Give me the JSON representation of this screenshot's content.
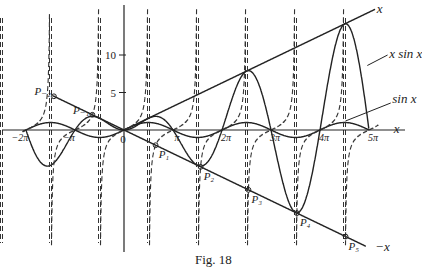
{
  "figure": {
    "caption": "Fig. 18"
  },
  "chart_data": {
    "type": "line",
    "title": "",
    "xlabel": "x",
    "ylabel": "",
    "xlim": [
      -6.5,
      16.3
    ],
    "ylim": [
      -16.5,
      16.5
    ],
    "grid": false,
    "legend": "inline labels",
    "origin_label": "0",
    "x_ticks": [
      {
        "value": -6.2832,
        "label": "−2π"
      },
      {
        "value": -3.1416,
        "label": "−π"
      },
      {
        "value": 3.1416,
        "label": "π"
      },
      {
        "value": 6.2832,
        "label": "2π"
      },
      {
        "value": 9.4248,
        "label": "3π"
      },
      {
        "value": 12.5664,
        "label": "4π"
      },
      {
        "value": 15.708,
        "label": "5π"
      }
    ],
    "y_ticks": [
      {
        "value": 5,
        "label": "5"
      },
      {
        "value": 10,
        "label": "10"
      }
    ],
    "series": [
      {
        "name": "x sin x",
        "expr": "x*sin(x)",
        "style": "solid",
        "x_range": [
          -6.2832,
          15.708
        ]
      },
      {
        "name": "sin x",
        "expr": "sin(x)",
        "style": "solid",
        "x_range": [
          -6.5,
          15.708
        ]
      },
      {
        "name": "x",
        "expr": "x",
        "style": "solid",
        "x_range": [
          0,
          16.1
        ]
      },
      {
        "name": "−x",
        "expr": "-x",
        "style": "solid",
        "x_range": [
          -4.6,
          15.5
        ]
      },
      {
        "name": "tan x",
        "expr": "tan(x)",
        "style": "dashed",
        "x_range": [
          -6.5,
          16.3
        ]
      }
    ],
    "annotations": [
      {
        "label": "x sin x",
        "at": [
          16.4,
          10.0
        ]
      },
      {
        "label": "sin x",
        "at": [
          16.2,
          3.0
        ]
      },
      {
        "label": "x",
        "at": [
          16.4,
          16.0
        ]
      },
      {
        "label": "−x",
        "at": [
          16.2,
          -15.2
        ]
      },
      {
        "label": "x",
        "at": [
          17.2,
          0.0
        ]
      }
    ],
    "points": [
      {
        "label": "P₋₂",
        "x": -4.4934,
        "y": 4.4934
      },
      {
        "label": "P₋₁",
        "x": -2.0288,
        "y": 2.0288
      },
      {
        "label": "P₁",
        "x": 2.0288,
        "y": -2.0288
      },
      {
        "label": "P₂",
        "x": 4.9132,
        "y": -4.9132
      },
      {
        "label": "P₃",
        "x": 7.9787,
        "y": -7.9787
      },
      {
        "label": "P₄",
        "x": 11.0855,
        "y": -11.0855
      },
      {
        "label": "P₅",
        "x": 14.2074,
        "y": -14.2074
      }
    ]
  }
}
